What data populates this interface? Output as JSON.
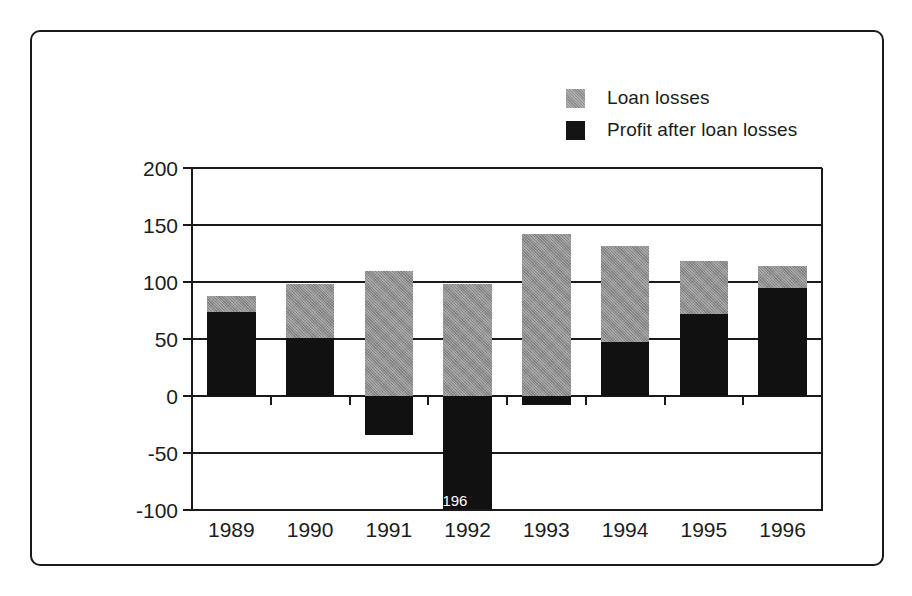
{
  "chart_data": {
    "type": "bar",
    "subtype": "stacked-with-negatives",
    "title": "",
    "subtitle": "",
    "xlabel": "",
    "ylabel": "",
    "categories": [
      "1989",
      "1990",
      "1991",
      "1992",
      "1993",
      "1994",
      "1995",
      "1996"
    ],
    "series": [
      {
        "name": "Loan losses",
        "color": "#8d8d8d",
        "values": [
          88,
          98,
          110,
          98,
          142,
          132,
          118,
          114
        ],
        "note": "Values are the top of the stacked bar (total); gray portion spans from the profit value up to this total."
      },
      {
        "name": "Profit after loan losses",
        "color": "#111111",
        "values": [
          74,
          51,
          -34,
          -196,
          -8,
          47,
          72,
          95
        ]
      }
    ],
    "ylim": [
      -100,
      200
    ],
    "yticks": [
      200,
      150,
      100,
      50,
      0,
      -50,
      -100
    ],
    "ytick_labels": [
      "200",
      "150",
      "100",
      "50",
      "0",
      "-50",
      "-100"
    ],
    "grid": true,
    "grid_axis": "y",
    "legend_position": "top-right",
    "annotations": [
      {
        "text": "-196",
        "category": "1992",
        "series": "Profit after loan losses",
        "note": "Bar is clipped at the -100 axis limit; true value labelled inside the bar in white text."
      }
    ]
  },
  "legend": {
    "entries": [
      {
        "label": "Loan losses",
        "swatch": "gray-swatch"
      },
      {
        "label": "Profit after loan losses",
        "swatch": "black-swatch"
      }
    ]
  },
  "axes": {
    "y_labels": [
      "200",
      "150",
      "100",
      "50",
      "0",
      "-50",
      "-100"
    ],
    "x_labels": [
      "1989",
      "1990",
      "1991",
      "1992",
      "1993",
      "1994",
      "1995",
      "1996"
    ]
  },
  "bar_label": "-196"
}
